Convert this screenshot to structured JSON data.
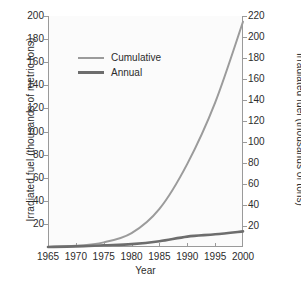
{
  "chart_data": {
    "type": "line",
    "title": "",
    "xlabel": "Year",
    "ylabel": "Irradiated fuel (thousands of metric tons)",
    "ylabel_right": "Irradiated fuel (thousands of tons)",
    "xlim": [
      1965,
      2000
    ],
    "ylim": [
      0,
      200
    ],
    "ylim_right": [
      0,
      220
    ],
    "xticks": [
      1965,
      1970,
      1975,
      1980,
      1985,
      1990,
      1995,
      2000
    ],
    "yticks_left": [
      20,
      40,
      60,
      80,
      100,
      120,
      140,
      160,
      180,
      200
    ],
    "yticks_right": [
      20,
      40,
      60,
      80,
      100,
      120,
      140,
      160,
      180,
      200,
      220
    ],
    "grid": false,
    "legend_position": "upper left",
    "x": [
      1965,
      1970,
      1975,
      1980,
      1985,
      1990,
      1995,
      2000
    ],
    "series": [
      {
        "name": "Cumulative",
        "color": "#9b9b9b",
        "values": [
          0,
          1,
          4,
          12,
          33,
          72,
          125,
          195
        ]
      },
      {
        "name": "Annual",
        "color": "#6d6d6d",
        "values": [
          0,
          0.5,
          1.5,
          2.5,
          5,
          9,
          11,
          13.5
        ]
      }
    ]
  },
  "legend": {
    "items": [
      {
        "label": "Cumulative"
      },
      {
        "label": "Annual"
      }
    ]
  },
  "colors": {
    "cumulative": "#9b9b9b",
    "annual": "#6d6d6d",
    "axis": "#9a9a9a",
    "text": "#2c2c2c",
    "plot_background": "#fbfbfb",
    "page_background": "#ffffff"
  }
}
